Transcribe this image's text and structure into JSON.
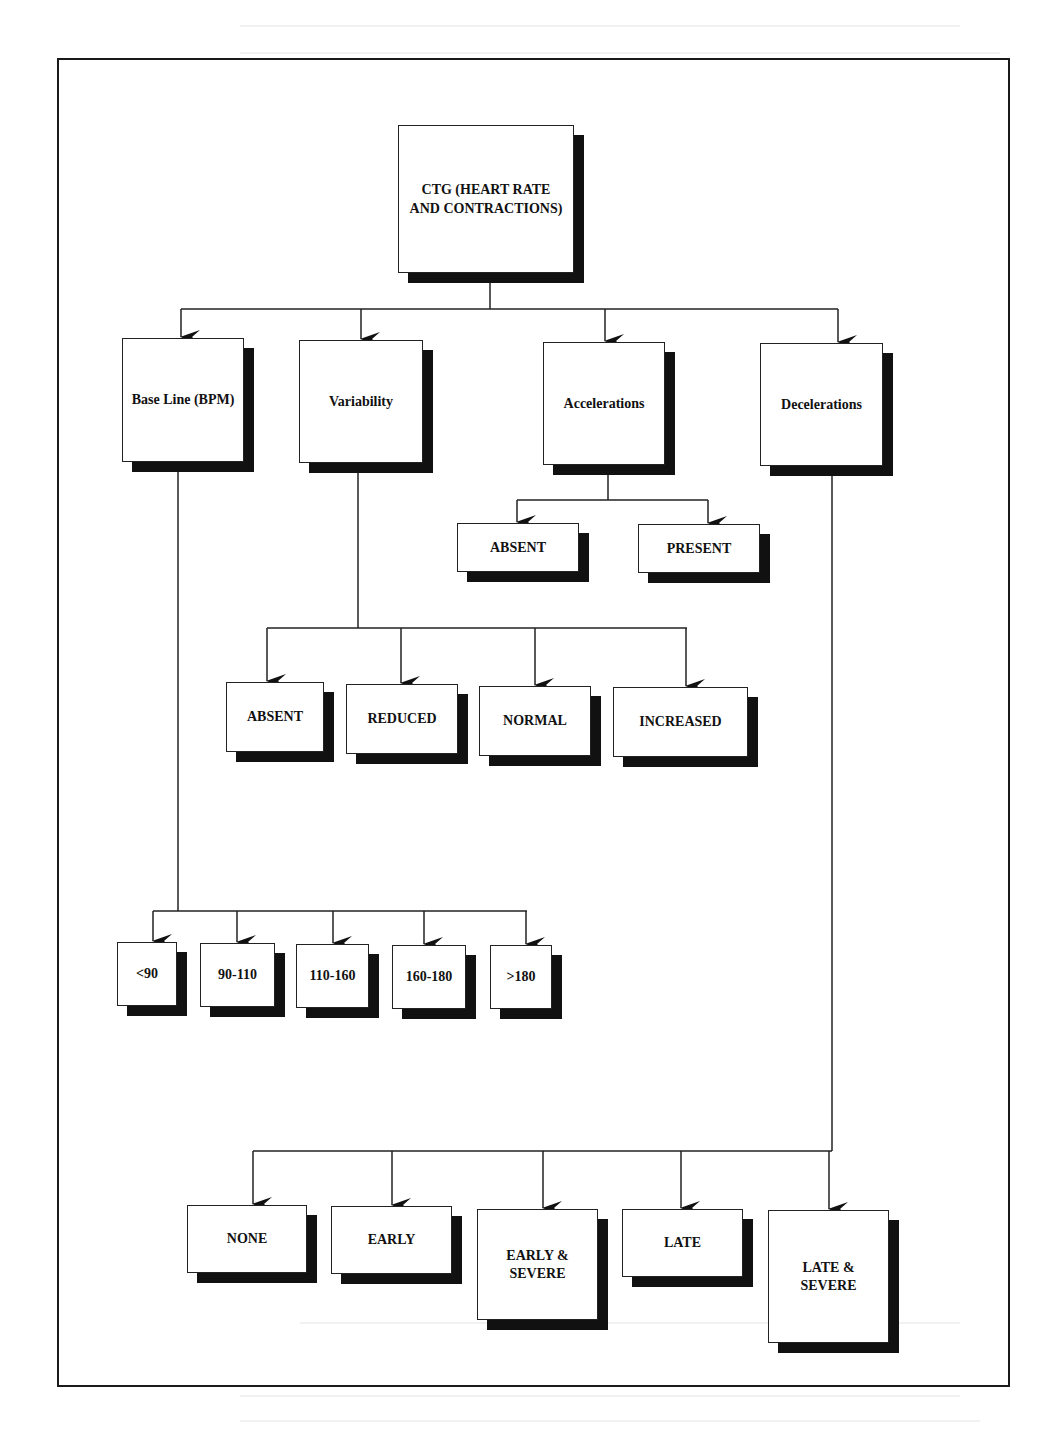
{
  "diagram": {
    "root": {
      "id": "ctg",
      "label": "CTG (HEART RATE\nAND CONTRACTIONS)"
    },
    "categories": [
      {
        "id": "baseline",
        "label": "Base Line (BPM)",
        "children": [
          "<90",
          "90-110",
          "110-160",
          "160-180",
          ">180"
        ]
      },
      {
        "id": "variability",
        "label": "Variability",
        "children": [
          "ABSENT",
          "REDUCED",
          "NORMAL",
          "INCREASED"
        ]
      },
      {
        "id": "accelerations",
        "label": "Accelerations",
        "children": [
          "ABSENT",
          "PRESENT"
        ]
      },
      {
        "id": "decelerations",
        "label": "Decelerations",
        "children": [
          "NONE",
          "EARLY",
          "EARLY &\nSEVERE",
          "LATE",
          "LATE &\nSEVERE"
        ]
      }
    ],
    "colors": {
      "box_fill": "#ffffff",
      "box_border": "#222222",
      "shadow": "#111111",
      "line": "#222222",
      "background": "#ffffff"
    }
  }
}
